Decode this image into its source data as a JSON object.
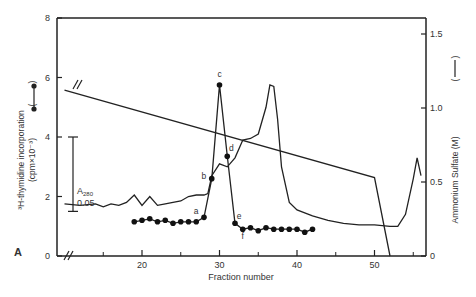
{
  "chart_data": {
    "type": "line",
    "panel_label": "A",
    "title": "",
    "xlabel": "Fraction number",
    "ylabel_left": "³H-thymidine incorporation (cpm×10⁻³)",
    "ylabel_right": "Ammonium Sulfate (M)",
    "xlim": [
      10,
      56
    ],
    "ylim_left": [
      0,
      8
    ],
    "ylim_right": [
      0,
      1.6
    ],
    "x_ticks": [
      20,
      30,
      40,
      50
    ],
    "x_minor_ticks": [
      15,
      25,
      35,
      45,
      55
    ],
    "y_left_ticks": [
      0,
      2,
      4,
      6,
      8
    ],
    "y_right_ticks": [
      0,
      0.5,
      1.0,
      1.5
    ],
    "y_right_tick_labels": [
      "0",
      "0.5",
      "1.0",
      "1.5"
    ],
    "grid": false,
    "scale_bar": {
      "label_main": "A",
      "label_sub": "280",
      "value": "0.05",
      "from_left_y": 1.5,
      "to_left_y": 4.0
    },
    "series": [
      {
        "name": "³H-thymidine incorporation",
        "axis": "left",
        "style": "line-with-filled-circles",
        "x": [
          19,
          20,
          21,
          22,
          23,
          24,
          25,
          26,
          27,
          28,
          29,
          30,
          31,
          32,
          33,
          34,
          35,
          36,
          37,
          38,
          39,
          40,
          41,
          42
        ],
        "values": [
          1.15,
          1.2,
          1.25,
          1.15,
          1.2,
          1.1,
          1.15,
          1.15,
          1.15,
          1.3,
          2.6,
          5.75,
          3.35,
          1.1,
          0.9,
          0.95,
          0.85,
          0.95,
          0.9,
          0.9,
          0.9,
          0.9,
          0.8,
          0.9
        ],
        "point_labels": {
          "28": "a",
          "29": "b",
          "30": "c",
          "31": "d",
          "32": "e",
          "33": "f"
        }
      },
      {
        "name": "A280 absorbance",
        "axis": "left",
        "style": "continuous-line",
        "x": [
          10,
          12,
          14,
          15,
          16,
          17,
          18,
          19,
          20,
          21,
          22,
          23,
          24,
          25,
          26,
          27,
          28,
          28.5,
          29,
          30,
          31,
          32,
          33,
          34,
          35,
          36,
          36.5,
          37,
          37.5,
          38,
          39,
          40,
          42,
          44,
          46,
          48,
          50,
          52,
          53,
          54,
          55,
          55.5,
          56
        ],
        "values": [
          1.75,
          1.7,
          1.75,
          1.65,
          1.75,
          1.7,
          1.8,
          2.05,
          1.7,
          2.0,
          1.7,
          1.75,
          1.8,
          1.85,
          2.0,
          2.05,
          2.05,
          2.1,
          2.7,
          3.1,
          3.0,
          3.3,
          3.9,
          3.95,
          4.1,
          5.0,
          5.75,
          5.7,
          4.6,
          3.0,
          1.8,
          1.55,
          1.35,
          1.2,
          1.1,
          1.05,
          1.05,
          1.0,
          1.0,
          1.4,
          2.6,
          3.3,
          2.7
        ]
      },
      {
        "name": "Ammonium sulfate gradient",
        "axis": "right",
        "style": "straight-line",
        "x": [
          10,
          50,
          52
        ],
        "values": [
          1.12,
          0.53,
          0
        ]
      }
    ],
    "legend": [
      {
        "label": "(●—●)",
        "series": "³H-thymidine incorporation"
      },
      {
        "label": "(——)",
        "series": "Ammonium sulfate"
      }
    ]
  }
}
